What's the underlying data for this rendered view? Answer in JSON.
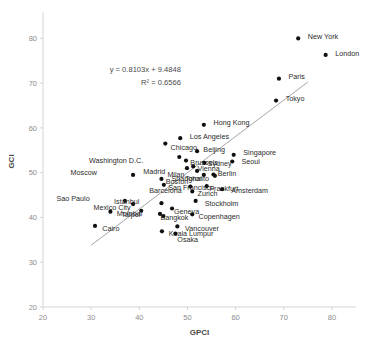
{
  "chart_data": {
    "type": "scatter",
    "title": "",
    "xlabel": "GPCI",
    "ylabel": "GCI",
    "xlim": [
      20,
      85
    ],
    "ylim": [
      20,
      85
    ],
    "xticks": [
      20,
      30,
      40,
      50,
      60,
      70,
      80
    ],
    "yticks": [
      20,
      30,
      40,
      50,
      60,
      70,
      80
    ],
    "grid": false,
    "legend": "none",
    "annotations": {
      "equation": "y = 0.8103x + 9.4848",
      "r_squared": "R² = 0.6566"
    },
    "trendline": {
      "slope": 0.8103,
      "intercept": 9.4848,
      "x_start": 30.0,
      "x_end": 75.0,
      "color": "#8e8e8e"
    },
    "marker_color": "#111111",
    "points": [
      {
        "label": "New York",
        "x": 73.0,
        "y": 80.0,
        "lx": 2.0,
        "ly": 0.4
      },
      {
        "label": "London",
        "x": 78.7,
        "y": 76.3,
        "lx": 2.0,
        "ly": 0.4
      },
      {
        "label": "Paris",
        "x": 69.0,
        "y": 71.0,
        "lx": 2.0,
        "ly": 0.4
      },
      {
        "label": "Tokyo",
        "x": 68.4,
        "y": 66.1,
        "lx": 2.0,
        "ly": 0.4
      },
      {
        "label": "Hong Kong",
        "x": 53.4,
        "y": 60.7,
        "lx": 2.0,
        "ly": 0.4
      },
      {
        "label": "Los Angeles",
        "x": 48.5,
        "y": 57.7,
        "lx": 2.0,
        "ly": 0.4
      },
      {
        "label": "Chicago",
        "x": 45.4,
        "y": 56.5,
        "lx": 1.1,
        "ly": -0.9
      },
      {
        "label": "Beijing",
        "x": 52.0,
        "y": 54.8,
        "lx": 1.3,
        "ly": 0.4
      },
      {
        "label": "Singapore",
        "x": 59.6,
        "y": 54.0,
        "lx": 2.0,
        "ly": 0.4
      },
      {
        "label": "Washington D.C.",
        "x": 48.3,
        "y": 53.5,
        "lx": -7.5,
        "ly": -0.7
      },
      {
        "label": "Seoul",
        "x": 59.3,
        "y": 52.5,
        "lx": 1.9,
        "ly": 0.0
      },
      {
        "label": "Brussels",
        "x": 49.7,
        "y": 52.7,
        "lx": 0.9,
        "ly": -0.5
      },
      {
        "label": "Sydney",
        "x": 53.5,
        "y": 52.2,
        "lx": 0.7,
        "ly": -0.1
      },
      {
        "label": "Vienna",
        "x": 51.2,
        "y": 51.4,
        "lx": 0.9,
        "ly": -0.4
      },
      {
        "label": "Madrid",
        "x": 49.9,
        "y": 51.0,
        "lx": -4.5,
        "ly": -0.7
      },
      {
        "label": "Milan",
        "x": 52.0,
        "y": 50.4,
        "lx": -2.6,
        "ly": -0.9
      },
      {
        "label": "Moscow",
        "x": 38.7,
        "y": 49.5,
        "lx": -7.5,
        "ly": 0.6
      },
      {
        "label": "Berlin",
        "x": 55.4,
        "y": 49.6,
        "lx": 0.9,
        "ly": 0.2
      },
      {
        "label": "Shanghai",
        "x": 53.4,
        "y": 49.5,
        "lx": -0.4,
        "ly": -0.8
      },
      {
        "label": "Boston",
        "x": 44.6,
        "y": 48.6,
        "lx": 0.9,
        "ly": -0.7
      },
      {
        "label": "Toronto",
        "x": 55.7,
        "y": 49.3,
        "lx": -1.2,
        "ly": -0.6
      },
      {
        "label": "San Francisco",
        "x": 45.1,
        "y": 47.3,
        "lx": 0.9,
        "ly": -0.7
      },
      {
        "label": "Frankfurt",
        "x": 54.0,
        "y": 47.0,
        "lx": 0.6,
        "ly": -0.5
      },
      {
        "label": "Barcelona",
        "x": 50.6,
        "y": 46.9,
        "lx": -1.8,
        "ly": -0.8
      },
      {
        "label": "Zurich",
        "x": 51.0,
        "y": 45.8,
        "lx": 1.1,
        "ly": -0.4
      },
      {
        "label": "Amsterdam",
        "x": 57.2,
        "y": 46.3,
        "lx": 1.9,
        "ly": -0.4
      },
      {
        "label": "Sao Paulo",
        "x": 37.0,
        "y": 43.7,
        "lx": -7.3,
        "ly": 0.6
      },
      {
        "label": "Istanbul",
        "x": 44.6,
        "y": 43.2,
        "lx": -4.6,
        "ly": 0.4
      },
      {
        "label": "Stockholm",
        "x": 51.7,
        "y": 43.7,
        "lx": 1.9,
        "ly": -0.6
      },
      {
        "label": "Mexico City",
        "x": 38.7,
        "y": 43.0,
        "lx": -0.5,
        "ly": -0.8
      },
      {
        "label": "Geneva",
        "x": 46.8,
        "y": 42.0,
        "lx": 0.4,
        "ly": -0.8
      },
      {
        "label": "Taipei",
        "x": 40.4,
        "y": 41.5,
        "lx": -0.2,
        "ly": -0.8
      },
      {
        "label": "Mumbai",
        "x": 34.0,
        "y": 41.3,
        "lx": 1.3,
        "ly": -0.5
      },
      {
        "label": "Copenhagen",
        "x": 51.0,
        "y": 40.7,
        "lx": 1.3,
        "ly": -0.4
      },
      {
        "label": "Bangkok",
        "x": 44.3,
        "y": 40.8,
        "lx": 0.1,
        "ly": -0.9
      },
      {
        "label": "Milan2",
        "x": 45.0,
        "y": 40.3,
        "lx": 0.0,
        "ly": 0.0
      },
      {
        "label": "Cairo",
        "x": 30.8,
        "y": 38.1,
        "lx": 1.5,
        "ly": -0.5
      },
      {
        "label": "Vancouver",
        "x": 47.9,
        "y": 38.0,
        "lx": 1.6,
        "ly": -0.4
      },
      {
        "label": "Kuala Lumpur",
        "x": 44.7,
        "y": 36.9,
        "lx": 1.4,
        "ly": -0.5
      },
      {
        "label": "Osaka",
        "x": 47.5,
        "y": 36.4,
        "lx": 0.4,
        "ly": -1.4
      }
    ]
  }
}
